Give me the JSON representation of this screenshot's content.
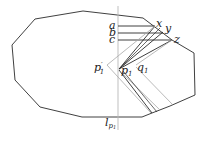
{
  "diagram": {
    "polygon": [
      [
        35,
        19
      ],
      [
        83,
        11
      ],
      [
        143,
        18
      ],
      [
        172,
        40
      ],
      [
        194,
        53
      ],
      [
        195,
        95
      ],
      [
        170,
        106
      ],
      [
        152,
        113
      ],
      [
        142,
        117
      ],
      [
        82,
        117
      ],
      [
        40,
        107
      ],
      [
        15,
        80
      ],
      [
        12,
        45
      ]
    ],
    "vertical_line": {
      "x": 118,
      "y1": 6,
      "y2": 130,
      "color": "#b8b8b8"
    },
    "labels": {
      "a": "a",
      "b": "b",
      "c": "c",
      "x": "x",
      "y": "y",
      "z": "z",
      "p1_prime_base": "p",
      "p1_prime_sub": "1",
      "p1_prime_mark": "′",
      "p1_base": "p",
      "p1_sub": "1",
      "q1_base": "q",
      "q1_sub": "1",
      "l_base": "l",
      "l_sub": "p",
      "l_subsub": "1"
    },
    "colors": {
      "stroke": "#2a2a2a",
      "gray": "#a8a8a8",
      "light": "#c4c4c4"
    }
  }
}
